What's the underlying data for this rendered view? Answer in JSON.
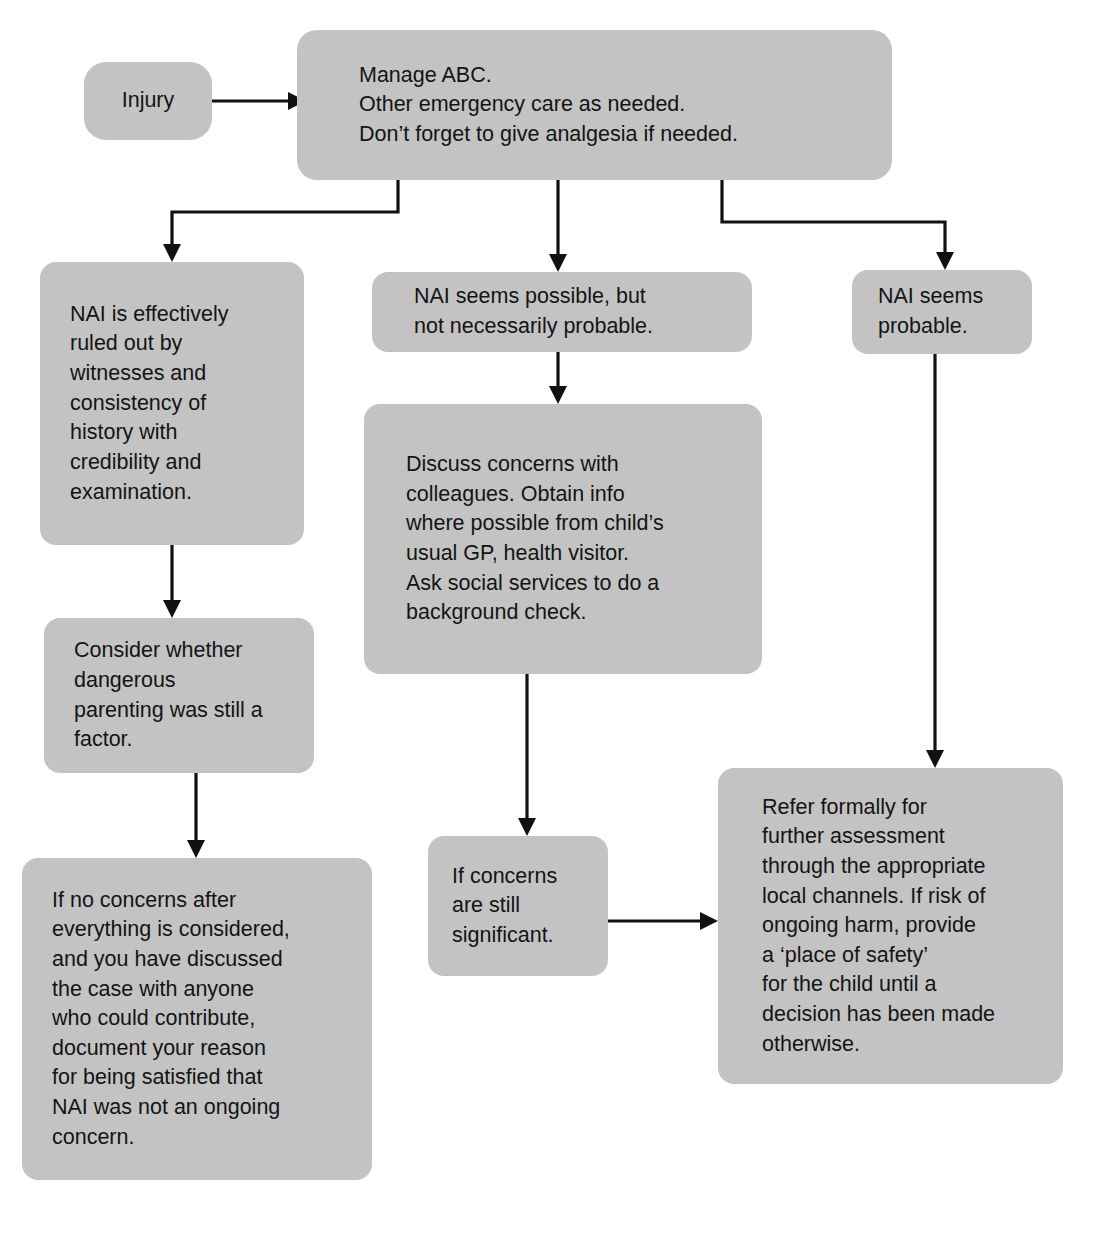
{
  "diagram": {
    "fill_color": "#c3c3c3",
    "line_color": "#111111",
    "text_color": "#141414"
  },
  "nodes": {
    "injury": "Injury",
    "manage": "Manage ABC.\nOther emergency care as needed.\nDon’t forget to give analgesia if needed.",
    "ruled_out": "NAI is effectively\nruled out by\nwitnesses and\nconsistency of\nhistory with\ncredibility and\nexamination.",
    "possible": "NAI seems possible, but\nnot necessarily probable.",
    "probable": "NAI seems\nprobable.",
    "discuss": "Discuss concerns with\ncolleagues.  Obtain info\nwhere possible from child’s\nusual GP, health visitor.\nAsk social services to do a\nbackground check.",
    "consider": "Consider whether\ndangerous\nparenting was still a\nfactor.",
    "if_concerns": "If concerns\nare still\nsignificant.",
    "refer": "Refer formally for\nfurther assessment\nthrough the appropriate\nlocal channels.  If risk of\nongoing harm, provide\na ‘place of safety’\nfor the child until a\ndecision has been made\notherwise.",
    "no_concerns": "If no concerns after\neverything is considered,\nand you have discussed\nthe case with anyone\nwho could contribute,\ndocument your reason\nfor being satisfied that\nNAI was not an ongoing\nconcern."
  },
  "edges": [
    {
      "from": "injury",
      "to": "manage",
      "style": "straight-right"
    },
    {
      "from": "manage",
      "to": "ruled_out",
      "style": "elbow-left"
    },
    {
      "from": "manage",
      "to": "possible",
      "style": "straight-down"
    },
    {
      "from": "manage",
      "to": "probable",
      "style": "elbow-right"
    },
    {
      "from": "ruled_out",
      "to": "consider",
      "style": "straight-down"
    },
    {
      "from": "consider",
      "to": "no_concerns",
      "style": "straight-down"
    },
    {
      "from": "possible",
      "to": "discuss",
      "style": "straight-down"
    },
    {
      "from": "discuss",
      "to": "if_concerns",
      "style": "straight-down"
    },
    {
      "from": "if_concerns",
      "to": "refer",
      "style": "straight-right"
    },
    {
      "from": "probable",
      "to": "refer",
      "style": "straight-down"
    }
  ]
}
